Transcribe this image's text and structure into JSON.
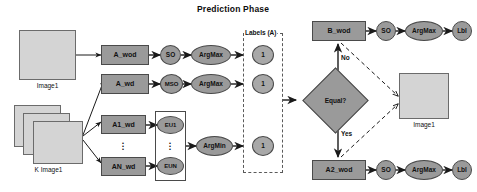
{
  "title": "Prediction Phase",
  "colors": {
    "node_fill": "#9a9a9a",
    "image_fill": "#d4d4d4",
    "stroke": "#4a4a4a",
    "dashed_stroke": "#5a5a5a",
    "text": "#111111",
    "background": "#ffffff"
  },
  "inputs": {
    "image1_caption": "Image1",
    "k_image1_caption": "K Image1"
  },
  "branch_top": {
    "process": "A_wod",
    "op": "SO",
    "selector": "ArgMax"
  },
  "branch_middle": {
    "process": "A_wd",
    "op": "MSO",
    "selector": "ArgMax"
  },
  "branch_bottom": {
    "process_first": "A1_wd",
    "process_last": "AN_wd",
    "eu_first": "EU1",
    "eu_last": "EUN",
    "selector": "ArgMin",
    "ellipsis": "⋮"
  },
  "labels_group": {
    "title": "Labels (A)",
    "values": [
      "1",
      "1",
      "1"
    ]
  },
  "decision": {
    "text": "Equal?",
    "yes_label": "Yes",
    "no_label": "No"
  },
  "path_no": {
    "process": "B_wod",
    "op": "SO",
    "selector": "ArgMax",
    "output": "Lbl"
  },
  "path_yes": {
    "process": "A2_wod",
    "op": "SO",
    "selector": "ArgMax",
    "output": "Lbl"
  },
  "output_image": {
    "caption": "Image1"
  }
}
